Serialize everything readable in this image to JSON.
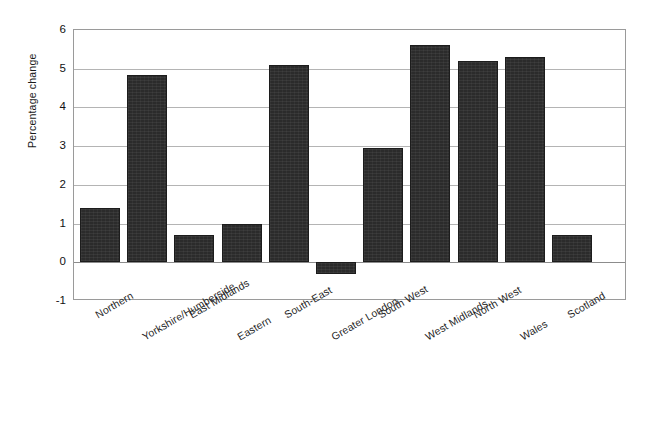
{
  "chart": {
    "type": "bar",
    "ylabel": "Percentage change",
    "title": "",
    "xlabel": ""
  },
  "chart_data": {
    "type": "bar",
    "title": "",
    "xlabel": "",
    "ylabel": "Percentage change",
    "ylim": [
      -1,
      6
    ],
    "yticks": [
      -1,
      0,
      1,
      2,
      3,
      4,
      5,
      6
    ],
    "ytick_labels": [
      "-1",
      "0",
      "1",
      "2",
      "3",
      "4",
      "5",
      "6"
    ],
    "grid": true,
    "legend": false,
    "bar_color": "#2b2b2b",
    "categories": [
      "Northern",
      "Yorkshire/Humberside",
      "East Midlands",
      "Eastern",
      "South-East",
      "Greater London",
      "South West",
      "West Midlands",
      "North West",
      "Wales",
      "Scotland"
    ],
    "values": [
      1.4,
      4.85,
      0.7,
      1.0,
      5.1,
      -0.3,
      2.95,
      5.6,
      5.2,
      5.3,
      0.7
    ]
  },
  "axis": {
    "tick_0": "6",
    "tick_1": "5",
    "tick_2": "4",
    "tick_3": "3",
    "tick_4": "2",
    "tick_5": "1",
    "tick_6": "0",
    "tick_7": "-1"
  }
}
